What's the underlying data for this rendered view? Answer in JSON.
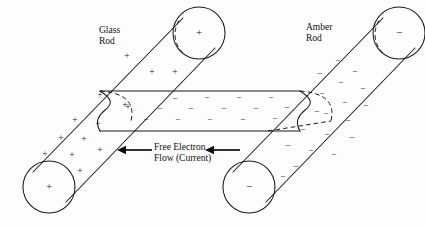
{
  "diagram": {
    "background_color": "#fdfdfd",
    "ink_color": "#1a1a1a"
  },
  "labels": {
    "glass_rod": "Glass\nRod",
    "amber_rod": "Amber\nRod",
    "current_flow": "Free Electron\nFlow (Current)"
  },
  "symbols": {
    "positive": "+",
    "negative": "−"
  },
  "glass_rod": {
    "name": "Glass Rod",
    "charge_sign": "+",
    "end_cap_top_charge": "+",
    "end_cap_bottom_charge": "+",
    "body_charges": [
      {
        "x": 127,
        "y": 57,
        "sign": "+"
      },
      {
        "x": 152,
        "y": 73,
        "sign": "+"
      },
      {
        "x": 175,
        "y": 73,
        "sign": "+"
      },
      {
        "x": 100,
        "y": 96,
        "sign": "+"
      },
      {
        "x": 128,
        "y": 108,
        "sign": "+"
      },
      {
        "x": 75,
        "y": 121,
        "sign": "+"
      },
      {
        "x": 98,
        "y": 125,
        "sign": "+"
      },
      {
        "x": 61,
        "y": 139,
        "sign": "+"
      },
      {
        "x": 84,
        "y": 140,
        "sign": "+"
      },
      {
        "x": 45,
        "y": 155,
        "sign": "+"
      },
      {
        "x": 72,
        "y": 156,
        "sign": "+"
      },
      {
        "x": 100,
        "y": 151,
        "sign": "+"
      },
      {
        "x": 80,
        "y": 172,
        "sign": "+"
      }
    ]
  },
  "amber_rod": {
    "name": "Amber Rod",
    "charge_sign": "−",
    "end_cap_top_charge": "−",
    "end_cap_bottom_charge": "−",
    "body_charges": [
      {
        "x": 338,
        "y": 62,
        "sign": "−"
      },
      {
        "x": 355,
        "y": 73,
        "sign": "−"
      },
      {
        "x": 320,
        "y": 75,
        "sign": "−"
      },
      {
        "x": 341,
        "y": 84,
        "sign": "−"
      },
      {
        "x": 363,
        "y": 90,
        "sign": "−"
      },
      {
        "x": 322,
        "y": 95,
        "sign": "−"
      },
      {
        "x": 345,
        "y": 104,
        "sign": "−"
      },
      {
        "x": 366,
        "y": 107,
        "sign": "−"
      },
      {
        "x": 326,
        "y": 115,
        "sign": "−"
      },
      {
        "x": 348,
        "y": 122,
        "sign": "−"
      },
      {
        "x": 303,
        "y": 131,
        "sign": "−"
      },
      {
        "x": 327,
        "y": 136,
        "sign": "−"
      },
      {
        "x": 352,
        "y": 139,
        "sign": "−"
      },
      {
        "x": 288,
        "y": 147,
        "sign": "−"
      },
      {
        "x": 311,
        "y": 152,
        "sign": "−"
      },
      {
        "x": 334,
        "y": 156,
        "sign": "−"
      },
      {
        "x": 296,
        "y": 168,
        "sign": "−"
      },
      {
        "x": 283,
        "y": 178,
        "sign": "−"
      }
    ]
  },
  "plate": {
    "name": "Connecting plate",
    "charge_sign": "−",
    "charges": [
      {
        "x": 175,
        "y": 100,
        "sign": "−"
      },
      {
        "x": 207,
        "y": 99,
        "sign": "−"
      },
      {
        "x": 239,
        "y": 99,
        "sign": "−"
      },
      {
        "x": 271,
        "y": 99,
        "sign": "−"
      },
      {
        "x": 160,
        "y": 110,
        "sign": "−"
      },
      {
        "x": 191,
        "y": 110,
        "sign": "−"
      },
      {
        "x": 224,
        "y": 110,
        "sign": "−"
      },
      {
        "x": 256,
        "y": 110,
        "sign": "−"
      },
      {
        "x": 287,
        "y": 109,
        "sign": "−"
      },
      {
        "x": 146,
        "y": 121,
        "sign": "−"
      },
      {
        "x": 178,
        "y": 121,
        "sign": "−"
      },
      {
        "x": 210,
        "y": 121,
        "sign": "−"
      },
      {
        "x": 243,
        "y": 121,
        "sign": "−"
      },
      {
        "x": 275,
        "y": 120,
        "sign": "−"
      }
    ]
  },
  "current_arrows": [
    {
      "name": "left-arrow",
      "x_tail": 152,
      "x_head": 117,
      "y": 150
    },
    {
      "name": "right-arrow",
      "x_tail": 240,
      "x_head": 205,
      "y": 150
    }
  ]
}
